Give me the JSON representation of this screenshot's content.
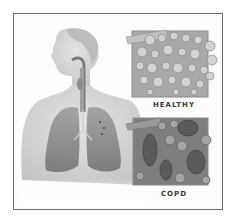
{
  "figure": {
    "panels": [
      {
        "label": "HEALTHY",
        "description": "Normal alveoli clusters"
      },
      {
        "label": "COPD",
        "description": "Damaged, enlarged alveoli"
      }
    ]
  },
  "colors": {
    "border": "#6e6e6e",
    "background": "#ffffff",
    "lung": "#8a8a8a",
    "skin": "#d6d6d6",
    "label": "#3a3a3a"
  }
}
